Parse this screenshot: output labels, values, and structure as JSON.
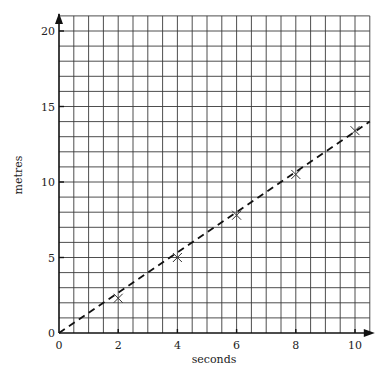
{
  "chart_data": {
    "type": "scatter",
    "title": "",
    "xlabel": "seconds",
    "ylabel": "metres",
    "xlim": [
      0,
      10.5
    ],
    "ylim": [
      0,
      21
    ],
    "x_ticks": [
      0,
      2,
      4,
      6,
      8,
      10
    ],
    "y_ticks": [
      0,
      5,
      10,
      15,
      20
    ],
    "x_tick_labels": [
      "0",
      "2",
      "4",
      "6",
      "8",
      "10"
    ],
    "y_tick_labels": [
      "0",
      "5",
      "10",
      "15",
      "20"
    ],
    "grid": {
      "on": true,
      "x_step": 0.5,
      "y_step": 1
    },
    "legend": null,
    "series": [
      {
        "name": "measurements",
        "marker": "x",
        "x": [
          2,
          4,
          6,
          8,
          10
        ],
        "y": [
          2.3,
          5.0,
          7.8,
          10.5,
          13.4
        ]
      }
    ],
    "fit_line": {
      "style": "dashed",
      "x": [
        0,
        10.5
      ],
      "y": [
        0,
        14.0
      ]
    }
  }
}
